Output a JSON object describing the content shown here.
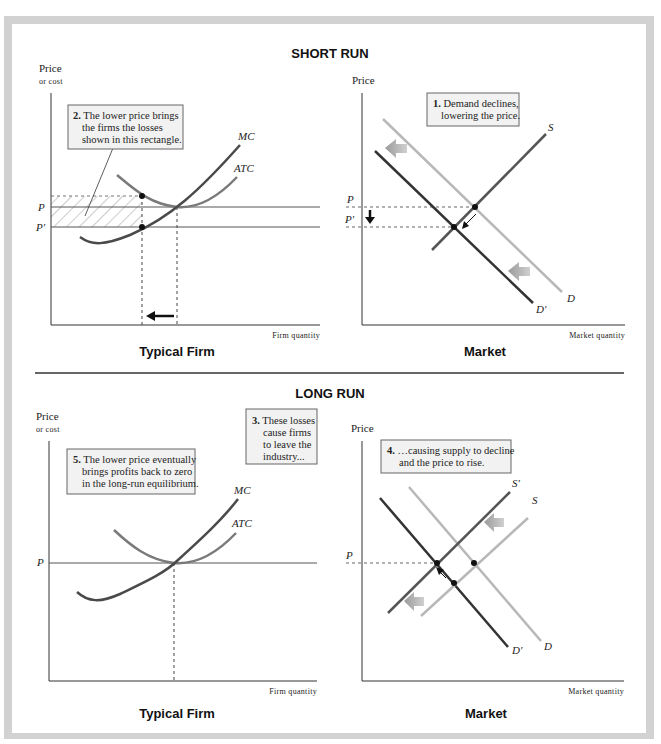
{
  "short_run": {
    "title": "SHORT RUN",
    "firm": {
      "y_axis_label_line1": "Price",
      "y_axis_label_line2": "or cost",
      "x_axis_label": "Firm quantity",
      "panel_title": "Typical Firm",
      "price_labels": {
        "p": "P",
        "p_prime": "P′"
      },
      "curves": {
        "mc": "MC",
        "atc": "ATC"
      },
      "note": {
        "number": "2.",
        "lines": [
          "The lower price brings",
          "the firms the losses",
          "shown in this rectangle."
        ]
      }
    },
    "market": {
      "y_axis_label": "Price",
      "x_axis_label": "Market quantity",
      "panel_title": "Market",
      "price_labels": {
        "p": "P",
        "p_prime": "P′"
      },
      "curves": {
        "s": "S",
        "d": "D",
        "d_prime": "D′"
      },
      "note": {
        "number": "1.",
        "lines": [
          "Demand declines,",
          "lowering the price."
        ]
      }
    }
  },
  "long_run": {
    "title": "LONG RUN",
    "firm": {
      "y_axis_label_line1": "Price",
      "y_axis_label_line2": "or cost",
      "x_axis_label": "Firm quantity",
      "panel_title": "Typical Firm",
      "price_labels": {
        "p": "P"
      },
      "curves": {
        "mc": "MC",
        "atc": "ATC"
      },
      "note": {
        "number": "5.",
        "lines": [
          "The lower price eventually",
          "brings profits back to zero",
          "in the long-run equilibrium."
        ]
      }
    },
    "middle_note": {
      "number": "3.",
      "lines": [
        "These losses",
        "cause firms",
        "to leave the",
        "industry..."
      ]
    },
    "market": {
      "y_axis_label": "Price",
      "x_axis_label": "Market quantity",
      "panel_title": "Market",
      "price_labels": {
        "p": "P"
      },
      "curves": {
        "s": "S",
        "s_prime": "S′",
        "d": "D",
        "d_prime": "D′"
      },
      "note": {
        "number": "4.",
        "lines": [
          "…causing supply to decline",
          "and the price to rise."
        ]
      }
    }
  },
  "colors": {
    "frame": "#d2d2d2",
    "dark_curve": "#3a3a3a",
    "mid_curve": "#6e6e6e",
    "light_curve": "#b8b8b8",
    "shift_arrow": "#a8a8a8",
    "note_fill": "#f2f2f2"
  }
}
